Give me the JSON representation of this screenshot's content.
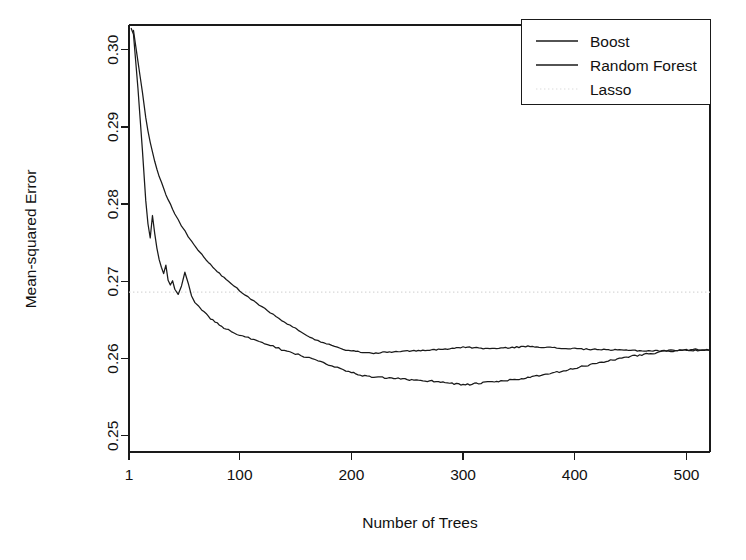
{
  "chart_data": {
    "type": "line",
    "title": "",
    "xlabel": "Number of Trees",
    "ylabel": "Mean-squared Error",
    "xlim": [
      1,
      521
    ],
    "ylim": [
      0.2479,
      0.3032
    ],
    "grid": false,
    "xticks": [
      1,
      100,
      200,
      300,
      400,
      500
    ],
    "xticklabels": [
      "1",
      "100",
      "200",
      "300",
      "400",
      "500"
    ],
    "yticks": [
      0.25,
      0.26,
      0.27,
      0.28,
      0.29,
      0.3
    ],
    "yticklabels": [
      "0.25",
      "0.26",
      "0.27",
      "0.28",
      "0.29",
      "0.30"
    ],
    "legend": {
      "position": "top-right",
      "entries": [
        {
          "name": "Boost",
          "style": "solid",
          "color": "#1a1a1a"
        },
        {
          "name": "Random Forest",
          "style": "solid",
          "color": "#1a1a1a"
        },
        {
          "name": "Lasso",
          "style": "dotted",
          "color": "#dcdcdc"
        }
      ]
    },
    "series": [
      {
        "name": "Boost",
        "style": "solid",
        "color": "#1a1a1a",
        "x": [
          1,
          5,
          9,
          13,
          16,
          18,
          20,
          22,
          24,
          26,
          28,
          30,
          32,
          34,
          36,
          38,
          40,
          42,
          45,
          48,
          51,
          54,
          57,
          60,
          63,
          66,
          70,
          74,
          78,
          82,
          86,
          90,
          95,
          100,
          105,
          110,
          115,
          120,
          125,
          130,
          135,
          140,
          145,
          150,
          155,
          160,
          165,
          170,
          175,
          180,
          185,
          190,
          195,
          200,
          210,
          220,
          230,
          240,
          250,
          260,
          270,
          280,
          290,
          300,
          310,
          320,
          330,
          340,
          350,
          360,
          370,
          380,
          390,
          400,
          410,
          420,
          430,
          440,
          450,
          460,
          470,
          480,
          490,
          500,
          510,
          520
        ],
        "y": [
          0.3035,
          0.302,
          0.295,
          0.287,
          0.2805,
          0.2775,
          0.2757,
          0.2785,
          0.2763,
          0.2742,
          0.2728,
          0.2718,
          0.2709,
          0.272,
          0.2702,
          0.2695,
          0.27,
          0.269,
          0.2684,
          0.2695,
          0.2712,
          0.2697,
          0.268,
          0.2673,
          0.2668,
          0.2663,
          0.2658,
          0.2652,
          0.2648,
          0.2644,
          0.264,
          0.2637,
          0.2634,
          0.263,
          0.2628,
          0.2626,
          0.2623,
          0.262,
          0.2618,
          0.2616,
          0.2613,
          0.261,
          0.2608,
          0.2606,
          0.2604,
          0.2602,
          0.26,
          0.2598,
          0.2595,
          0.2592,
          0.259,
          0.2587,
          0.2584,
          0.2582,
          0.2578,
          0.2576,
          0.2575,
          0.2574,
          0.2573,
          0.2572,
          0.2571,
          0.257,
          0.2568,
          0.2566,
          0.2567,
          0.2569,
          0.257,
          0.2572,
          0.2573,
          0.2576,
          0.2578,
          0.2581,
          0.2584,
          0.2587,
          0.2591,
          0.2594,
          0.2597,
          0.26,
          0.2603,
          0.2605,
          0.2607,
          0.2609,
          0.261,
          0.2611,
          0.2611,
          0.2611
        ]
      },
      {
        "name": "Random Forest",
        "style": "solid",
        "color": "#1a1a1a",
        "x": [
          1,
          5,
          9,
          13,
          16,
          18,
          20,
          22,
          24,
          26,
          28,
          30,
          32,
          34,
          36,
          38,
          40,
          42,
          45,
          48,
          51,
          54,
          57,
          60,
          63,
          66,
          70,
          74,
          78,
          82,
          86,
          90,
          95,
          100,
          105,
          110,
          115,
          120,
          125,
          130,
          135,
          140,
          145,
          150,
          155,
          160,
          165,
          170,
          175,
          180,
          185,
          190,
          195,
          200,
          210,
          220,
          230,
          240,
          250,
          260,
          270,
          280,
          290,
          300,
          310,
          320,
          330,
          340,
          350,
          360,
          370,
          380,
          390,
          400,
          410,
          420,
          430,
          440,
          450,
          460,
          470,
          480,
          490,
          500,
          510,
          520
        ],
        "y": [
          0.304,
          0.3025,
          0.2985,
          0.2945,
          0.2912,
          0.2895,
          0.288,
          0.2868,
          0.2856,
          0.2845,
          0.2836,
          0.2828,
          0.282,
          0.2813,
          0.2806,
          0.28,
          0.2794,
          0.2788,
          0.278,
          0.2772,
          0.2765,
          0.2758,
          0.2752,
          0.2746,
          0.274,
          0.2735,
          0.2728,
          0.2722,
          0.2716,
          0.271,
          0.2705,
          0.27,
          0.2694,
          0.2688,
          0.2682,
          0.2677,
          0.2672,
          0.2667,
          0.2662,
          0.2657,
          0.2652,
          0.2647,
          0.2643,
          0.2639,
          0.2634,
          0.263,
          0.2626,
          0.2623,
          0.262,
          0.2618,
          0.2615,
          0.2613,
          0.2611,
          0.261,
          0.2608,
          0.2607,
          0.2608,
          0.2609,
          0.261,
          0.261,
          0.2611,
          0.2612,
          0.2613,
          0.2615,
          0.2614,
          0.2613,
          0.2613,
          0.2614,
          0.2615,
          0.2616,
          0.2615,
          0.2614,
          0.2613,
          0.2613,
          0.2612,
          0.2612,
          0.2611,
          0.2611,
          0.2611,
          0.261,
          0.261,
          0.261,
          0.2611,
          0.2611,
          0.2612,
          0.2611
        ]
      },
      {
        "name": "Lasso",
        "style": "dotted",
        "color": "#dcdcdc",
        "type": "hline",
        "value": 0.2686
      }
    ]
  }
}
